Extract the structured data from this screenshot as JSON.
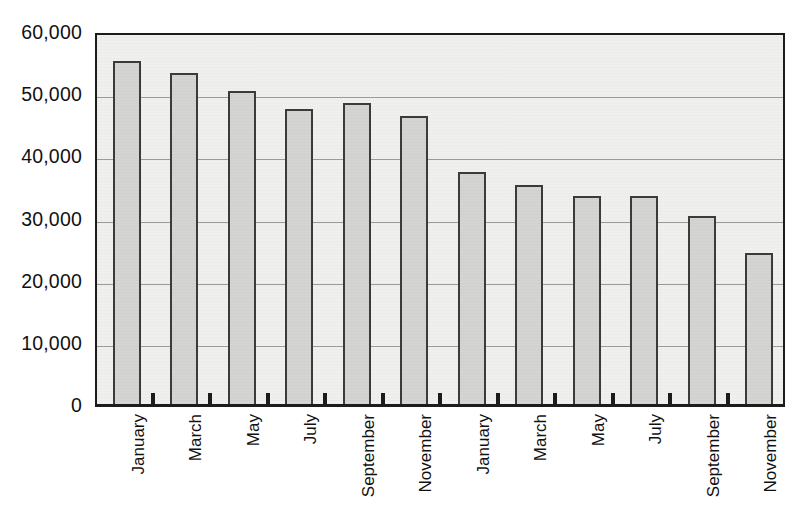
{
  "chart_data": {
    "type": "bar",
    "title": "",
    "subtitle": "",
    "xlabel": "",
    "ylabel": "",
    "categories": [
      "January",
      "March",
      "May",
      "July",
      "September",
      "November",
      "January",
      "March",
      "May",
      "July",
      "September",
      "November"
    ],
    "values": [
      55200,
      53300,
      50300,
      47400,
      48400,
      46300,
      37300,
      35300,
      33400,
      33400,
      30300,
      24300
    ],
    "series": [
      {
        "name": "",
        "values": [
          55200,
          53300,
          50300,
          47400,
          48400,
          46300,
          37300,
          35300,
          33400,
          33400,
          30300,
          24300
        ]
      }
    ],
    "ylim": [
      0,
      60000
    ],
    "yticks": [
      0,
      10000,
      20000,
      30000,
      40000,
      50000,
      60000
    ],
    "ytick_labels": [
      "0",
      "10,000",
      "20,000",
      "30,000",
      "40,000",
      "50,000",
      "60,000"
    ],
    "grid": true,
    "grid_axis": "y",
    "legend": false,
    "legend_position": "none",
    "annotations": [],
    "colors": {
      "bar_fill": "#d4d4d2",
      "bar_border": "#3b3b3b",
      "plot_background": "#f0f0ef",
      "frame": "#1c1c1c",
      "gridline": "#9a9a9a",
      "text": "#111111",
      "page_background": "#ffffff"
    }
  }
}
